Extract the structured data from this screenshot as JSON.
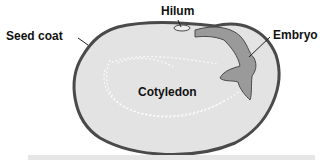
{
  "diagram": {
    "labels": {
      "seed_coat": "Seed coat",
      "hilum": "Hilum",
      "embryo": "Embryo",
      "cotyledon": "Cotyledon"
    },
    "colors": {
      "seed_coat": "#4a4a4a",
      "cotyledon_fill": "#e3e3e3",
      "embryo_fill": "#9a9a9a",
      "hilum_fill": "#eeeeee",
      "bottom_bar": "#e6e6e6"
    }
  }
}
